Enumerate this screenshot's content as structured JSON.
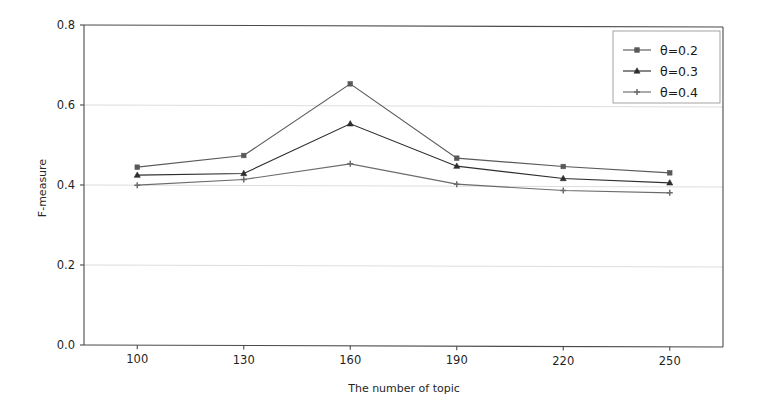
{
  "chart_data": {
    "type": "line",
    "title": "",
    "xlabel": "The number of topic",
    "ylabel": "F-measure",
    "x": [
      100,
      130,
      160,
      190,
      220,
      250
    ],
    "xtick_labels": [
      "100",
      "130",
      "160",
      "190",
      "220",
      "250"
    ],
    "ytick_labels": [
      "0.0",
      "0.2",
      "0.4",
      "0.6",
      "0.8"
    ],
    "yticks": [
      0.0,
      0.2,
      0.4,
      0.6,
      0.8
    ],
    "ylim": [
      0.0,
      0.8
    ],
    "xlim": [
      85,
      265
    ],
    "grid": "horizontal",
    "legend_position": "upper right",
    "series": [
      {
        "name": "θ=0.2",
        "marker": "square",
        "color": "#595959",
        "values": [
          0.445,
          0.475,
          0.655,
          0.47,
          0.45,
          0.435
        ]
      },
      {
        "name": "θ=0.3",
        "marker": "triangle",
        "color": "#2e2e2e",
        "values": [
          0.425,
          0.43,
          0.555,
          0.45,
          0.42,
          0.41
        ]
      },
      {
        "name": "θ=0.4",
        "marker": "plus",
        "color": "#6b6b6b",
        "values": [
          0.4,
          0.415,
          0.455,
          0.405,
          0.39,
          0.385
        ]
      }
    ]
  },
  "axes": {
    "y_axis_label": "F-measure",
    "x_axis_label": "The number of topic"
  },
  "legend": {
    "entries": [
      {
        "label": "θ=0.2"
      },
      {
        "label": "θ=0.3"
      },
      {
        "label": "θ=0.4"
      }
    ]
  },
  "ticks": {
    "x": [
      "100",
      "130",
      "160",
      "190",
      "220",
      "250"
    ],
    "y": [
      "0.0",
      "0.2",
      "0.4",
      "0.6",
      "0.8"
    ]
  },
  "colors": {
    "series_1": "#595959",
    "series_2": "#2e2e2e",
    "series_3": "#6b6b6b",
    "grid": "#cfcfcf",
    "spine": "#4a4a4a",
    "background": "#ffffff"
  }
}
